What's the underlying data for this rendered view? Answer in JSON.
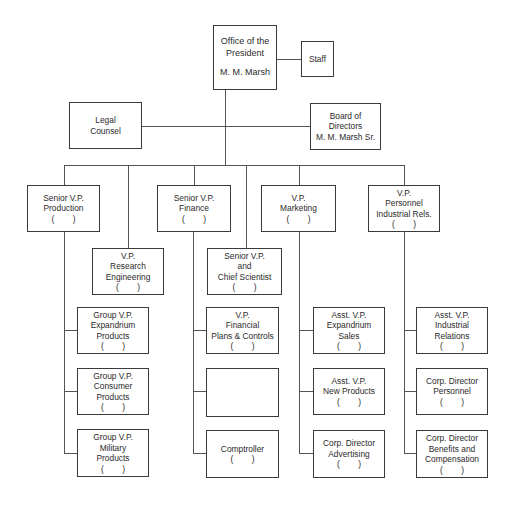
{
  "chart": {
    "president": {
      "lines": [
        "Office of the",
        "President"
      ],
      "name": "M. M. Marsh"
    },
    "staff": {
      "label": "Staff"
    },
    "legal": {
      "lines": [
        "Legal",
        "Counsel"
      ]
    },
    "board": {
      "lines": [
        "Board of",
        "Directors",
        "M. M. Marsh Sr."
      ]
    },
    "production": {
      "lines": [
        "Senior V.P.",
        "Production"
      ],
      "placeholder": "(        )"
    },
    "finance": {
      "lines": [
        "Senior V.P.",
        "Finance"
      ],
      "placeholder": "(        )"
    },
    "marketing": {
      "lines": [
        "V.P.",
        "Marketing"
      ],
      "placeholder": "(        )"
    },
    "personnel": {
      "lines": [
        "V.P.",
        "Personnel",
        "Industrial Rels."
      ],
      "placeholder": "(        )"
    },
    "research": {
      "lines": [
        "V.P.",
        "Research",
        "Engineering"
      ],
      "placeholder": "(        )"
    },
    "scientist": {
      "lines": [
        "Senior V.P.",
        "and",
        "Chief Scientist"
      ],
      "placeholder": "(        )"
    },
    "production_subs": [
      {
        "lines": [
          "Group V.P.",
          "Expandrium",
          "Products"
        ],
        "placeholder": "(        )"
      },
      {
        "lines": [
          "Group V.P.",
          "Consumer",
          "Products"
        ],
        "placeholder": "(        )"
      },
      {
        "lines": [
          "Group V.P.",
          "Military",
          "Products"
        ],
        "placeholder": "(        )"
      }
    ],
    "finance_subs": [
      {
        "lines": [
          "V.P.",
          "Financial",
          "Plans & Controls"
        ],
        "placeholder": "(        )"
      },
      {
        "lines": [],
        "placeholder": ""
      },
      {
        "lines": [
          "Comptroller"
        ],
        "placeholder": "(        )"
      }
    ],
    "marketing_subs": [
      {
        "lines": [
          "Asst. V.P.",
          "Expandrium",
          "Sales"
        ],
        "placeholder": "(        )"
      },
      {
        "lines": [
          "Asst. V.P.",
          "New Products"
        ],
        "placeholder": "(        )"
      },
      {
        "lines": [
          "Corp. Director",
          "Advertising"
        ],
        "placeholder": "(        )"
      }
    ],
    "personnel_subs": [
      {
        "lines": [
          "Asst. V.P.",
          "Industrial",
          "Relations"
        ],
        "placeholder": "(        )"
      },
      {
        "lines": [
          "Corp. Director",
          "Personnel"
        ],
        "placeholder": "(        )"
      },
      {
        "lines": [
          "Corp. Director",
          "Benefits and",
          "Compensation"
        ],
        "placeholder": "(        )"
      }
    ]
  }
}
